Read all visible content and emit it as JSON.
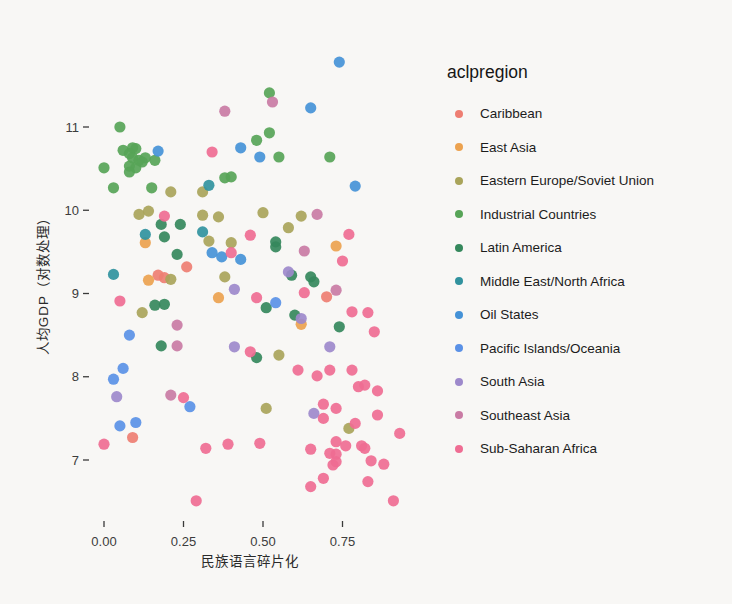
{
  "chart_data": {
    "type": "scatter",
    "xlabel": "民族语言碎片化",
    "ylabel": "人均GDP（对数处理）",
    "legend_title": "aclpregion",
    "legend_position": "right",
    "grid": false,
    "xlim": [
      -0.05,
      0.97
    ],
    "ylim": [
      6.4,
      11.9
    ],
    "xticks": [
      {
        "v": 0.0,
        "label": "0.00"
      },
      {
        "v": 0.25,
        "label": "0.25"
      },
      {
        "v": 0.5,
        "label": "0.50"
      },
      {
        "v": 0.75,
        "label": "0.75"
      }
    ],
    "yticks": [
      {
        "v": 7,
        "label": "7"
      },
      {
        "v": 8,
        "label": "8"
      },
      {
        "v": 9,
        "label": "9"
      },
      {
        "v": 10,
        "label": "10"
      },
      {
        "v": 11,
        "label": "11"
      }
    ],
    "series": [
      {
        "name": "Caribbean",
        "color": "#ee7e72",
        "points": [
          [
            0.17,
            9.22
          ],
          [
            0.19,
            9.19
          ],
          [
            0.26,
            9.32
          ],
          [
            0.7,
            8.96
          ],
          [
            0.09,
            7.27
          ]
        ]
      },
      {
        "name": "East Asia",
        "color": "#eca24f",
        "points": [
          [
            0.13,
            9.61
          ],
          [
            0.14,
            9.16
          ],
          [
            0.36,
            8.95
          ],
          [
            0.73,
            9.57
          ],
          [
            0.62,
            8.63
          ]
        ]
      },
      {
        "name": "Eastern Europe/Soviet Union",
        "color": "#a9a45a",
        "points": [
          [
            0.11,
            9.95
          ],
          [
            0.14,
            9.99
          ],
          [
            0.21,
            10.22
          ],
          [
            0.31,
            10.22
          ],
          [
            0.31,
            9.94
          ],
          [
            0.36,
            9.92
          ],
          [
            0.33,
            9.63
          ],
          [
            0.4,
            9.61
          ],
          [
            0.21,
            9.17
          ],
          [
            0.38,
            9.2
          ],
          [
            0.12,
            8.77
          ],
          [
            0.5,
            9.97
          ],
          [
            0.62,
            9.93
          ],
          [
            0.58,
            9.79
          ],
          [
            0.55,
            8.26
          ],
          [
            0.51,
            7.62
          ],
          [
            0.77,
            7.38
          ]
        ]
      },
      {
        "name": "Industrial Countries",
        "color": "#57a457",
        "points": [
          [
            0.05,
            11.0
          ],
          [
            0.06,
            10.72
          ],
          [
            0.09,
            10.75
          ],
          [
            0.1,
            10.74
          ],
          [
            0.08,
            10.68
          ],
          [
            0.09,
            10.63
          ],
          [
            0.11,
            10.6
          ],
          [
            0.13,
            10.63
          ],
          [
            0.08,
            10.53
          ],
          [
            0.1,
            10.51
          ],
          [
            0.12,
            10.58
          ],
          [
            0.08,
            10.46
          ],
          [
            0.16,
            10.6
          ],
          [
            0.0,
            10.51
          ],
          [
            0.03,
            10.27
          ],
          [
            0.15,
            10.27
          ],
          [
            0.38,
            10.39
          ],
          [
            0.4,
            10.4
          ],
          [
            0.52,
            11.41
          ],
          [
            0.52,
            10.93
          ],
          [
            0.48,
            10.84
          ],
          [
            0.55,
            10.64
          ],
          [
            0.71,
            10.64
          ]
        ]
      },
      {
        "name": "Latin America",
        "color": "#35885c",
        "points": [
          [
            0.18,
            9.83
          ],
          [
            0.24,
            9.83
          ],
          [
            0.19,
            9.68
          ],
          [
            0.23,
            9.47
          ],
          [
            0.16,
            8.86
          ],
          [
            0.19,
            8.87
          ],
          [
            0.18,
            8.37
          ],
          [
            0.54,
            9.62
          ],
          [
            0.54,
            9.56
          ],
          [
            0.59,
            9.22
          ],
          [
            0.65,
            9.2
          ],
          [
            0.66,
            9.14
          ],
          [
            0.51,
            8.83
          ],
          [
            0.6,
            8.74
          ],
          [
            0.74,
            8.6
          ],
          [
            0.48,
            8.23
          ]
        ]
      },
      {
        "name": "Middle East/North Africa",
        "color": "#31929e",
        "points": [
          [
            0.13,
            9.71
          ],
          [
            0.31,
            9.74
          ],
          [
            0.03,
            9.23
          ],
          [
            0.33,
            10.3
          ]
        ]
      },
      {
        "name": "Oil States",
        "color": "#4592d7",
        "points": [
          [
            0.74,
            11.78
          ],
          [
            0.65,
            11.23
          ],
          [
            0.43,
            10.75
          ],
          [
            0.49,
            10.64
          ],
          [
            0.79,
            10.29
          ],
          [
            0.17,
            10.71
          ],
          [
            0.34,
            9.49
          ],
          [
            0.37,
            9.44
          ],
          [
            0.43,
            9.41
          ]
        ]
      },
      {
        "name": "Pacific Islands/Oceania",
        "color": "#5a91e6",
        "points": [
          [
            0.54,
            8.89
          ],
          [
            0.08,
            8.5
          ],
          [
            0.06,
            8.1
          ],
          [
            0.03,
            7.97
          ],
          [
            0.27,
            7.64
          ],
          [
            0.05,
            7.41
          ],
          [
            0.1,
            7.45
          ]
        ]
      },
      {
        "name": "South Asia",
        "color": "#9d89cb",
        "points": [
          [
            0.41,
            9.05
          ],
          [
            0.58,
            9.26
          ],
          [
            0.62,
            8.7
          ],
          [
            0.71,
            8.36
          ],
          [
            0.41,
            8.36
          ],
          [
            0.04,
            7.76
          ],
          [
            0.66,
            7.56
          ]
        ]
      },
      {
        "name": "Southeast Asia",
        "color": "#c97ba4",
        "points": [
          [
            0.38,
            11.19
          ],
          [
            0.53,
            11.3
          ],
          [
            0.67,
            9.95
          ],
          [
            0.63,
            9.51
          ],
          [
            0.73,
            9.04
          ],
          [
            0.23,
            8.62
          ],
          [
            0.23,
            8.37
          ],
          [
            0.21,
            7.78
          ]
        ]
      },
      {
        "name": "Sub-Saharan Africa",
        "color": "#ef6d93",
        "points": [
          [
            0.34,
            10.7
          ],
          [
            0.19,
            9.93
          ],
          [
            0.46,
            9.7
          ],
          [
            0.4,
            9.49
          ],
          [
            0.77,
            9.71
          ],
          [
            0.75,
            9.39
          ],
          [
            0.05,
            8.91
          ],
          [
            0.48,
            8.95
          ],
          [
            0.63,
            9.01
          ],
          [
            0.83,
            8.77
          ],
          [
            0.78,
            8.78
          ],
          [
            0.85,
            8.54
          ],
          [
            0.46,
            8.3
          ],
          [
            0.61,
            8.08
          ],
          [
            0.67,
            8.01
          ],
          [
            0.71,
            8.08
          ],
          [
            0.78,
            8.08
          ],
          [
            0.8,
            7.88
          ],
          [
            0.82,
            7.9
          ],
          [
            0.86,
            7.83
          ],
          [
            0.25,
            7.75
          ],
          [
            0.69,
            7.67
          ],
          [
            0.73,
            7.62
          ],
          [
            0.69,
            7.5
          ],
          [
            0.86,
            7.54
          ],
          [
            0.79,
            7.44
          ],
          [
            0.93,
            7.32
          ],
          [
            0.0,
            7.19
          ],
          [
            0.32,
            7.14
          ],
          [
            0.39,
            7.19
          ],
          [
            0.49,
            7.2
          ],
          [
            0.73,
            7.22
          ],
          [
            0.76,
            7.17
          ],
          [
            0.81,
            7.17
          ],
          [
            0.82,
            7.14
          ],
          [
            0.65,
            7.13
          ],
          [
            0.71,
            7.08
          ],
          [
            0.73,
            7.07
          ],
          [
            0.73,
            6.98
          ],
          [
            0.72,
            6.94
          ],
          [
            0.84,
            6.99
          ],
          [
            0.88,
            6.95
          ],
          [
            0.69,
            6.78
          ],
          [
            0.83,
            6.74
          ],
          [
            0.65,
            6.68
          ],
          [
            0.91,
            6.51
          ],
          [
            0.29,
            6.51
          ]
        ]
      }
    ]
  }
}
